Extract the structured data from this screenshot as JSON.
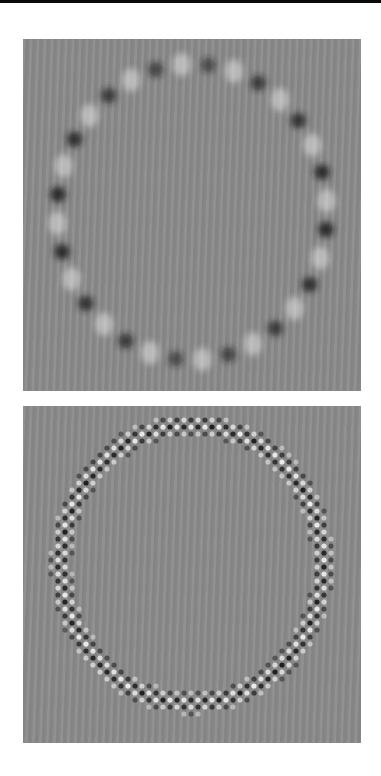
{
  "figure": {
    "panels": [
      {
        "name": "blurred-ring",
        "description": "Blurred ring of alternating dark and light spots on gray background",
        "box": {
          "x": 23,
          "y": 39,
          "w": 338,
          "h": 352
        },
        "ring": {
          "cx": 169,
          "cy": 173,
          "rx": 135,
          "ry": 148,
          "spots": 32,
          "blur": 3.2,
          "spot_r": 9
        },
        "colors": {
          "background": "#8b8b8b",
          "dark": "#1e1e1e",
          "light": "#e6e6e6"
        }
      },
      {
        "name": "checkerboard-ring",
        "description": "Sharp ring band of small checkerboard dots on gray background",
        "box": {
          "x": 23,
          "y": 406,
          "w": 338,
          "h": 337
        },
        "ring": {
          "cx": 169,
          "cy": 158,
          "rx": 131,
          "ry": 139,
          "band": 22,
          "pitch": 7,
          "dot_r": 2.6
        },
        "colors": {
          "background": "#8b8b8b",
          "dark": "#1a1a1a",
          "light": "#f2f2f2"
        }
      }
    ],
    "colors": {
      "page": "#ffffff",
      "top_bar": "#0a0a0a"
    }
  }
}
